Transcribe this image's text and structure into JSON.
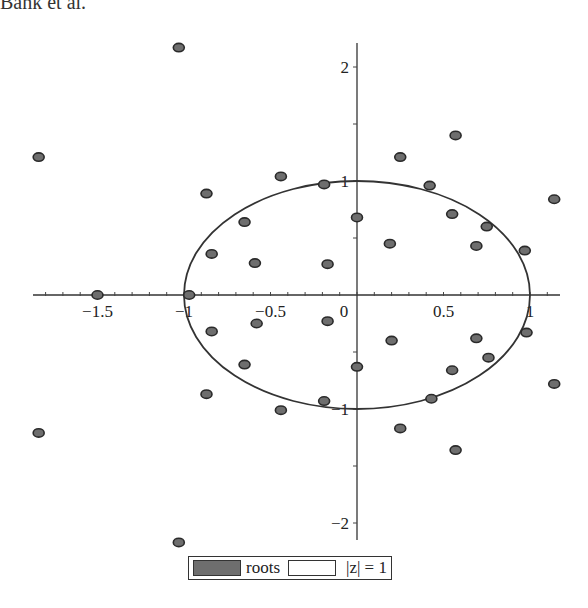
{
  "header": {
    "text": "Bahk et al."
  },
  "chart_data": {
    "type": "scatter",
    "title": "",
    "xlabel": "",
    "ylabel": "",
    "xlim": [
      -1.87,
      1.18
    ],
    "ylim": [
      -2.2,
      2.2
    ],
    "grid": false,
    "legend_position": "bottom",
    "x_ticks": [
      {
        "value": -1.5,
        "label": "-1.5"
      },
      {
        "value": -1,
        "label": "-1"
      },
      {
        "value": -0.5,
        "label": "-0.5"
      },
      {
        "value": 0,
        "label": "0"
      },
      {
        "value": 0.5,
        "label": "0.5"
      },
      {
        "value": 1,
        "label": "1"
      }
    ],
    "y_ticks": [
      {
        "value": 2,
        "label": "2"
      },
      {
        "value": 1,
        "label": "1"
      },
      {
        "value": -1,
        "label": "-1"
      },
      {
        "value": -2,
        "label": "-2"
      }
    ],
    "series": [
      {
        "name": "roots",
        "style": "filled-ellipse-marker",
        "color": "#6e6e6e",
        "points": [
          [
            -1.03,
            2.17
          ],
          [
            -1.03,
            -2.17
          ],
          [
            -1.84,
            1.21
          ],
          [
            -1.84,
            -1.21
          ],
          [
            -0.87,
            0.89
          ],
          [
            -0.87,
            -0.87
          ],
          [
            -0.44,
            1.04
          ],
          [
            -0.44,
            -1.01
          ],
          [
            -0.19,
            0.97
          ],
          [
            -0.19,
            -0.93
          ],
          [
            -0.65,
            0.64
          ],
          [
            -0.65,
            -0.61
          ],
          [
            0.0,
            0.68
          ],
          [
            0.0,
            -0.63
          ],
          [
            -0.84,
            0.36
          ],
          [
            -0.84,
            -0.32
          ],
          [
            -0.59,
            0.28
          ],
          [
            -0.58,
            -0.25
          ],
          [
            -0.17,
            0.27
          ],
          [
            -0.17,
            -0.23
          ],
          [
            0.57,
            1.4
          ],
          [
            0.57,
            -1.36
          ],
          [
            0.25,
            1.21
          ],
          [
            0.25,
            -1.17
          ],
          [
            0.42,
            0.96
          ],
          [
            0.43,
            -0.91
          ],
          [
            0.55,
            0.71
          ],
          [
            0.55,
            -0.66
          ],
          [
            0.75,
            0.6
          ],
          [
            0.76,
            -0.55
          ],
          [
            1.14,
            0.84
          ],
          [
            1.14,
            -0.78
          ],
          [
            0.19,
            0.45
          ],
          [
            0.2,
            -0.4
          ],
          [
            0.69,
            0.43
          ],
          [
            0.69,
            -0.38
          ],
          [
            0.97,
            0.39
          ],
          [
            0.98,
            -0.33
          ],
          [
            -1.5,
            0.0
          ],
          [
            -0.97,
            0.0
          ]
        ]
      },
      {
        "name": "|z| = 1",
        "style": "line",
        "color": "#333333",
        "shape": "unit-circle"
      }
    ]
  },
  "legend": {
    "items": [
      {
        "label": "roots",
        "swatch": "filled"
      },
      {
        "label": "|z| = 1",
        "swatch": "empty"
      }
    ]
  }
}
